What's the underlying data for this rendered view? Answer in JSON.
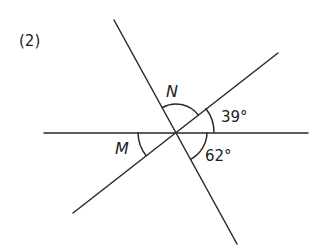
{
  "problem_number": "(2)",
  "diagram": {
    "stroke_color": "#2a2a2a",
    "intersection": {
      "x": 176,
      "y": 132
    },
    "lines": [
      {
        "name": "horizontal-line",
        "x1": 44,
        "y1": 133,
        "x2": 308,
        "y2": 133
      },
      {
        "name": "steep-line",
        "x1": 114,
        "y1": 20,
        "x2": 237,
        "y2": 244
      },
      {
        "name": "shallow-line",
        "x1": 73,
        "y1": 213,
        "x2": 278,
        "y2": 53
      }
    ],
    "angles": [
      {
        "id": "N",
        "label": "N",
        "italic": true,
        "description": "angle between steep line (upper) and shallow line (upper-right)"
      },
      {
        "id": "39",
        "label": "39°",
        "italic": false,
        "value_deg": 39,
        "description": "angle between shallow line (upper-right) and horizontal line (right)"
      },
      {
        "id": "62",
        "label": "62°",
        "italic": false,
        "value_deg": 62,
        "description": "angle between horizontal line (right) and steep line (lower)"
      },
      {
        "id": "M",
        "label": "M",
        "italic": true,
        "description": "angle between horizontal line (left) and shallow line (lower-left)"
      }
    ]
  }
}
